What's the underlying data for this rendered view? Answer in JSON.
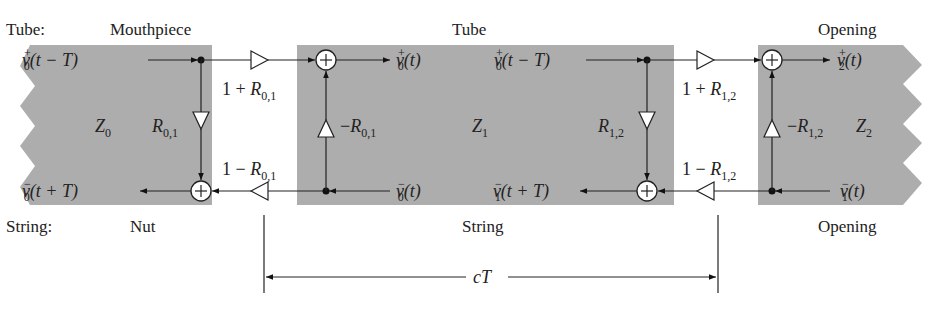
{
  "diagram": {
    "title_rows": {
      "tube_prefix": "Tube:",
      "string_prefix": "String:"
    },
    "sections": [
      {
        "id": "left",
        "top_label": "Mouthpiece",
        "bottom_label": "Nut",
        "impedance": "Z",
        "impedance_sub": "0"
      },
      {
        "id": "middle",
        "top_label": "Tube",
        "bottom_label": "String",
        "impedance": "Z",
        "impedance_sub": "1"
      },
      {
        "id": "right",
        "top_label": "Opening",
        "bottom_label": "Opening",
        "impedance": "Z",
        "impedance_sub": "2"
      }
    ],
    "signals": {
      "left_top_in": {
        "v": "v",
        "sup": "+",
        "sub": "0",
        "arg": "(t − T)"
      },
      "left_bottom_out": {
        "v": "v",
        "sup": "−",
        "sub": "0",
        "arg": "(t + T)"
      },
      "mid_top_out": {
        "v": "v",
        "sup": "+",
        "sub": "0",
        "arg": "(t)"
      },
      "mid_bottom_in": {
        "v": "v",
        "sup": "−",
        "sub": "0",
        "arg": "(t)"
      },
      "mid_top_in": {
        "v": "v",
        "sup": "+",
        "sub": "0",
        "arg": "(t − T)"
      },
      "mid_bottom_out": {
        "v": "v",
        "sup": "−",
        "sub": "1",
        "arg": "(t + T)"
      },
      "right_top_out": {
        "v": "v",
        "sup": "+",
        "sub": "2",
        "arg": "(t)"
      },
      "right_bottom_in": {
        "v": "v",
        "sup": "−",
        "sub": "1",
        "arg": "(t)"
      }
    },
    "gains": {
      "j01_forward": {
        "prefix": "1 + ",
        "R": "R",
        "sub": "0,1"
      },
      "j01_backward": {
        "prefix": "1 − ",
        "R": "R",
        "sub": "0,1"
      },
      "j01_reflect_left": {
        "prefix": "",
        "R": "R",
        "sub": "0,1"
      },
      "j01_reflect_right": {
        "prefix": "−",
        "R": "R",
        "sub": "0,1"
      },
      "j12_forward": {
        "prefix": "1 + ",
        "R": "R",
        "sub": "1,2"
      },
      "j12_backward": {
        "prefix": "1 − ",
        "R": "R",
        "sub": "1,2"
      },
      "j12_reflect_left": {
        "prefix": "",
        "R": "R",
        "sub": "1,2"
      },
      "j12_reflect_right": {
        "prefix": "−",
        "R": "R",
        "sub": "1,2"
      }
    },
    "dimension": {
      "label_c": "c",
      "label_T": "T"
    },
    "sum_symbol": "+",
    "colors": {
      "panel": "#adadad",
      "line": "#222222",
      "background": "#ffffff"
    }
  }
}
